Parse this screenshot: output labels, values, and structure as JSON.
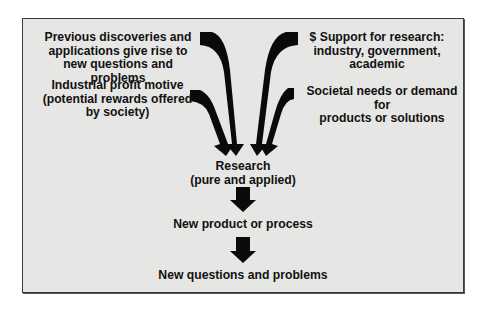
{
  "diagram": {
    "inputs": {
      "previous_discoveries": "Previous discoveries and\napplications give rise to\nnew questions and problems",
      "profit_motive": "Industrial profit motive\n(potential rewards offered\nby society)",
      "support": "$ Support for research:\nindustry, government,\nacademic",
      "societal_needs": "Societal needs or demand for\nproducts or solutions"
    },
    "flow": [
      {
        "label": "Research\n(pure and applied)"
      },
      {
        "label": "New product or process"
      },
      {
        "label": "New questions and problems"
      }
    ],
    "colors": {
      "background": "#e6e6e4",
      "border": "#3a3a3a",
      "arrow": "#0a0a0a",
      "text": "#111111"
    }
  }
}
